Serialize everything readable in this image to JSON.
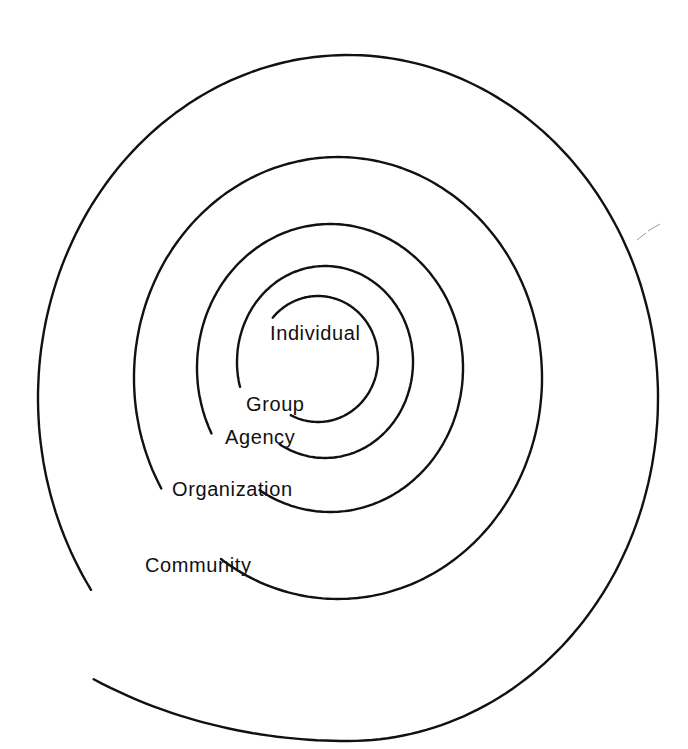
{
  "diagram": {
    "type": "spiral",
    "title": "",
    "stroke_color": "#111111",
    "background": "#ffffff",
    "levels": [
      {
        "label": "Individual",
        "label_pos": [
          270,
          323
        ],
        "ring": {
          "cx": 318,
          "cy": 359,
          "rx": 60,
          "ry": 63,
          "start_deg": 221,
          "end_deg": 477,
          "grow": 0
        }
      },
      {
        "label": "Group",
        "label_pos": [
          246,
          394
        ],
        "ring": {
          "cx": 325,
          "cy": 362,
          "rx": 88,
          "ry": 96,
          "start_deg": 165,
          "end_deg": 481,
          "grow": 0
        }
      },
      {
        "label": "Agency",
        "label_pos": [
          225,
          427
        ],
        "ring": {
          "cx": 330,
          "cy": 368,
          "rx": 133,
          "ry": 144,
          "start_deg": 153,
          "end_deg": 482,
          "grow": 0
        }
      },
      {
        "label": "Organization",
        "label_pos": [
          172,
          479
        ],
        "ring": {
          "cx": 338,
          "cy": 378,
          "rx": 204,
          "ry": 221,
          "start_deg": 150,
          "end_deg": 485,
          "grow": 0
        }
      },
      {
        "label": "Community",
        "label_pos": [
          145,
          555
        ],
        "ring": {
          "cx": 348,
          "cy": 398,
          "rx": 310,
          "ry": 343,
          "start_deg": 146,
          "end_deg": 495,
          "grow": 0.16
        }
      }
    ]
  }
}
